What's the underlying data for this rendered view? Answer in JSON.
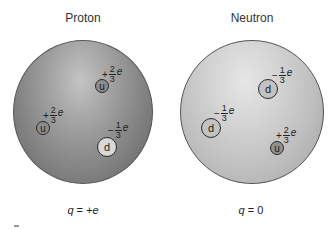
{
  "figure": {
    "panels": [
      {
        "title": "Proton",
        "total_charge": {
          "var": "q",
          "eq": "=",
          "value": "+e"
        },
        "quarks": [
          {
            "flavor": "u",
            "sign": "+",
            "numerator": "2",
            "denominator": "3",
            "unit": "e"
          },
          {
            "flavor": "u",
            "sign": "+",
            "numerator": "2",
            "denominator": "3",
            "unit": "e"
          },
          {
            "flavor": "d",
            "sign": "−",
            "numerator": "1",
            "denominator": "3",
            "unit": "e"
          }
        ]
      },
      {
        "title": "Neutron",
        "total_charge": {
          "var": "q",
          "eq": "=",
          "value": "0"
        },
        "quarks": [
          {
            "flavor": "d",
            "sign": "−",
            "numerator": "1",
            "denominator": "3",
            "unit": "e"
          },
          {
            "flavor": "d",
            "sign": "−",
            "numerator": "1",
            "denominator": "3",
            "unit": "e"
          },
          {
            "flavor": "u",
            "sign": "+",
            "numerator": "2",
            "denominator": "3",
            "unit": "e"
          }
        ]
      }
    ]
  }
}
